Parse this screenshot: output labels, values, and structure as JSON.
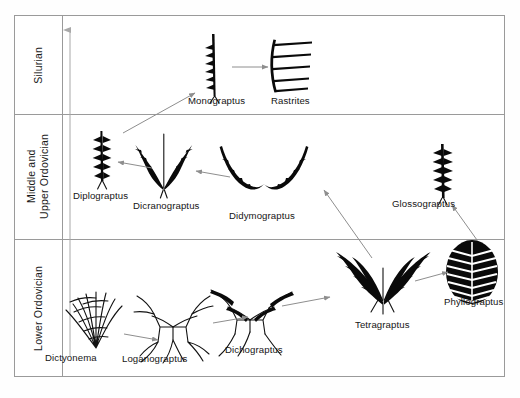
{
  "figure": {
    "type": "range-chart"
  },
  "eras": [
    {
      "id": "silurian",
      "label": "Silurian"
    },
    {
      "id": "middle-upper-ordovician",
      "label": "Middle and\nUpper Ordovician"
    },
    {
      "id": "lower-ordovician",
      "label": "Lower  Ordovician"
    }
  ],
  "genera": [
    {
      "id": "monograptus",
      "label": "Monograptus",
      "era": "silurian"
    },
    {
      "id": "rastrites",
      "label": "Rastrites",
      "era": "silurian"
    },
    {
      "id": "diplograptus",
      "label": "Diplograptus",
      "era": "middle-upper-ordovician"
    },
    {
      "id": "dicranograptus",
      "label": "Dicranograptus",
      "era": "middle-upper-ordovician"
    },
    {
      "id": "didymograptus",
      "label": "Didymograptus",
      "era": "middle-upper-ordovician"
    },
    {
      "id": "glossograptus",
      "label": "Glossograptus",
      "era": "middle-upper-ordovician"
    },
    {
      "id": "dictyonema",
      "label": "Dictyonema",
      "era": "lower-ordovician"
    },
    {
      "id": "loganograptus",
      "label": "Loganograptus",
      "era": "lower-ordovician"
    },
    {
      "id": "dichograptus",
      "label": "Dichograptus",
      "era": "lower-ordovician"
    },
    {
      "id": "tetragraptus",
      "label": "Tetragraptus",
      "era": "lower-ordovician"
    },
    {
      "id": "phyllograptus",
      "label": "Phyllograptus",
      "era": "lower-ordovician"
    }
  ],
  "lineages": [
    {
      "from": "dictyonema",
      "to": "loganograptus"
    },
    {
      "from": "loganograptus",
      "to": "dichograptus"
    },
    {
      "from": "dichograptus",
      "to": "tetragraptus"
    },
    {
      "from": "tetragraptus",
      "to": "phyllograptus"
    },
    {
      "from": "phyllograptus",
      "to": "glossograptus"
    },
    {
      "from": "tetragraptus",
      "to": "didymograptus"
    },
    {
      "from": "didymograptus",
      "to": "dicranograptus"
    },
    {
      "from": "dicranograptus",
      "to": "diplograptus"
    },
    {
      "from": "diplograptus",
      "to": "monograptus"
    },
    {
      "from": "monograptus",
      "to": "rastrites"
    }
  ],
  "time_axis": {
    "direction": "upward",
    "meaning": "younger"
  },
  "colors": {
    "fossil": "#0a0a0a",
    "rule": "#9a9a9a",
    "arrow": "#8e8e8e",
    "text": "#151515"
  }
}
